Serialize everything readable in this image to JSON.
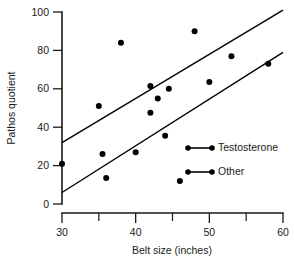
{
  "chart_data": {
    "type": "scatter",
    "title": "",
    "xlabel": "Belt size (inches)",
    "ylabel": "Pathos quotient",
    "xlim": [
      30,
      60
    ],
    "ylim": [
      0,
      100
    ],
    "xticks": [
      30,
      40,
      50,
      60
    ],
    "xticks_labels": [
      "30",
      "40",
      "50",
      "60"
    ],
    "xticks_minor": [
      35,
      45,
      55
    ],
    "yticks": [
      0,
      20,
      40,
      60,
      80,
      100
    ],
    "yticks_labels": [
      "0",
      "20",
      "40",
      "60",
      "80",
      "100"
    ],
    "grid": false,
    "legend_position": "inside-right",
    "series": [
      {
        "name": "Testosterone",
        "marker": "filled-circle",
        "color": "#000000",
        "points": [
          [
            35,
            51
          ],
          [
            38,
            84
          ],
          [
            42,
            61.5
          ],
          [
            43,
            55
          ],
          [
            44.5,
            60
          ],
          [
            48,
            90
          ],
          [
            50,
            63.5
          ],
          [
            53,
            77
          ]
        ],
        "fit_line": {
          "x_start": 30,
          "y_start": 32,
          "x_end": 60,
          "y_end": 101
        }
      },
      {
        "name": "Other",
        "marker": "filled-circle",
        "color": "#000000",
        "points": [
          [
            30,
            21
          ],
          [
            35.5,
            26
          ],
          [
            36,
            13.5
          ],
          [
            40,
            27
          ],
          [
            42,
            47.5
          ],
          [
            44,
            35.5
          ],
          [
            46,
            12
          ],
          [
            58,
            73
          ]
        ],
        "fit_line": {
          "x_start": 30,
          "y_start": 6,
          "x_end": 60,
          "y_end": 79
        }
      }
    ]
  },
  "legend": {
    "entries": [
      {
        "label": "Testosterone"
      },
      {
        "label": "Other"
      }
    ]
  }
}
